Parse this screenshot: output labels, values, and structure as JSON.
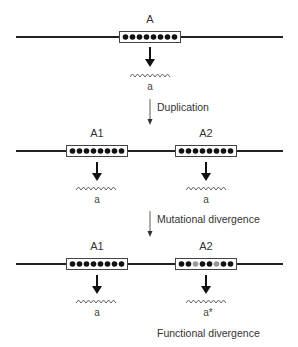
{
  "stages": [
    {
      "genes": [
        {
          "label": "A",
          "product": "a",
          "dots": [
            "#111",
            "#111",
            "#111",
            "#111",
            "#111",
            "#111",
            "#111",
            "#111"
          ]
        }
      ]
    },
    {
      "step_label": "Duplication",
      "genes": [
        {
          "label": "A1",
          "product": "a",
          "dots": [
            "#111",
            "#111",
            "#111",
            "#111",
            "#111",
            "#111",
            "#111",
            "#111"
          ]
        },
        {
          "label": "A2",
          "product": "a",
          "dots": [
            "#111",
            "#111",
            "#111",
            "#111",
            "#111",
            "#111",
            "#111",
            "#111"
          ]
        }
      ]
    },
    {
      "step_label": "Mutational divergence",
      "genes": [
        {
          "label": "A1",
          "product": "a",
          "dots": [
            "#111",
            "#111",
            "#111",
            "#111",
            "#111",
            "#111",
            "#111",
            "#111"
          ]
        },
        {
          "label": "A2",
          "product": "a*",
          "dots": [
            "#111",
            "#111",
            "#999",
            "#111",
            "#111",
            "#999",
            "#111",
            "#111"
          ]
        }
      ]
    }
  ],
  "footer_label": "Functional divergence",
  "colors": {
    "line": "#222222",
    "box_fill": "#ffffff",
    "box_stroke": "#444444",
    "dot": "#111111",
    "mutated_dot": "#999999"
  }
}
